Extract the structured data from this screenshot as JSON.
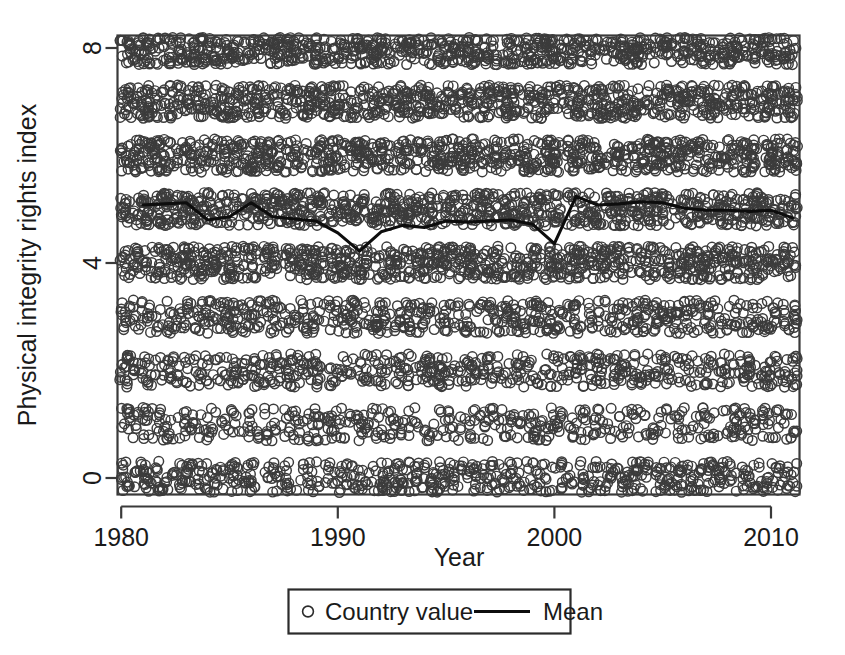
{
  "chart_data": {
    "type": "scatter",
    "title": "",
    "xlabel": "Year",
    "ylabel": "Physical integrity rights index",
    "xlim": [
      1980,
      2011
    ],
    "ylim": [
      0,
      8
    ],
    "xticks": [
      1980,
      1990,
      2000,
      2010
    ],
    "xtick_labels": [
      "1980",
      "1990",
      "2000",
      "2010"
    ],
    "yticks": [
      0,
      4,
      8
    ],
    "ytick_labels": [
      "0",
      "4",
      "8"
    ],
    "grid": false,
    "legend_position": "below-axes-center",
    "legend": [
      {
        "label": "Country value",
        "marker": "open-circle",
        "color": "#3c3c3c"
      },
      {
        "label": "Mean",
        "marker": "line",
        "color": "#0d0d0d"
      }
    ],
    "series": [
      {
        "name": "Country value",
        "type": "scatter",
        "marker": "open-circle",
        "jitter": true,
        "levels": [
          0,
          1,
          2,
          3,
          4,
          5,
          6,
          7,
          8
        ],
        "level_counts_per_year": {
          "0": 22,
          "1": 16,
          "2": 20,
          "3": 22,
          "4": 30,
          "5": 30,
          "6": 30,
          "7": 30,
          "8": 36
        },
        "x_range": [
          1980,
          2011
        ]
      },
      {
        "name": "Mean",
        "type": "line",
        "x": [
          1981,
          1982,
          1983,
          1984,
          1985,
          1986,
          1987,
          1988,
          1989,
          1990,
          1991,
          1992,
          1993,
          1994,
          1995,
          1996,
          1997,
          1998,
          1999,
          2000,
          2001,
          2002,
          2003,
          2004,
          2005,
          2006,
          2007,
          2008,
          2009,
          2010,
          2011
        ],
        "values": [
          5.08,
          5.1,
          5.12,
          4.8,
          4.86,
          5.12,
          4.86,
          4.82,
          4.78,
          4.56,
          4.22,
          4.58,
          4.7,
          4.66,
          4.78,
          4.76,
          4.78,
          4.8,
          4.72,
          4.36,
          5.24,
          5.08,
          5.1,
          5.14,
          5.12,
          5.02,
          4.98,
          4.98,
          4.96,
          4.98,
          4.84
        ]
      }
    ]
  },
  "axis": {
    "y_label": "Physical integrity rights index",
    "x_label": "Year"
  },
  "legend": {
    "country_value_label": "Country value",
    "mean_label": "Mean"
  },
  "colors": {
    "point_stroke": "#3c3c3c",
    "mean_line": "#0d0d0d",
    "frame": "#3a3a3a",
    "background": "#ffffff"
  }
}
